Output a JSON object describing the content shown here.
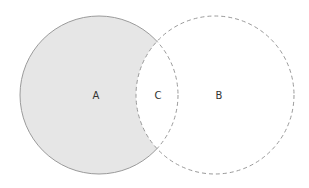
{
  "diagram": {
    "type": "venn",
    "sets": [
      {
        "id": "A",
        "label": "A",
        "cx": 99,
        "cy": 95,
        "r": 79
      },
      {
        "id": "B",
        "label": "B",
        "cx": 215,
        "cy": 95,
        "r": 79
      }
    ],
    "regions": [
      {
        "id": "A_only",
        "label": "A",
        "x": 96,
        "y": 95,
        "shaded": true
      },
      {
        "id": "intersection",
        "label": "C",
        "x": 158,
        "y": 95,
        "shaded": false
      },
      {
        "id": "B_only",
        "label": "B",
        "x": 219,
        "y": 95,
        "shaded": false
      }
    ],
    "colors": {
      "shade": "#e6e6e6",
      "stroke": "#9a9a9a"
    }
  }
}
